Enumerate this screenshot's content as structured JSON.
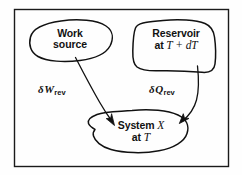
{
  "figure": {
    "name": "reversible-heat-and-work-exchange-diagram",
    "frame_color": "#1a1a1a",
    "ink_color": "#111111",
    "background": "#fefefe",
    "width": 242,
    "height": 175
  },
  "nodes": {
    "work_source": {
      "line1": "Work",
      "line2": "source"
    },
    "reservoir": {
      "line1": "Reservoir",
      "line2_prefix": "at",
      "line2_math": "T + dT"
    },
    "system": {
      "line1_prefix": "System",
      "line1_math": "X",
      "line2_prefix": "at",
      "line2_math": "T"
    }
  },
  "flows": {
    "work": {
      "delta": "δ",
      "symbol": "W",
      "subscript": "rev",
      "from": "work_source",
      "to": "system"
    },
    "heat": {
      "delta": "δ",
      "symbol": "Q",
      "subscript": "rev",
      "from": "reservoir",
      "to": "system"
    }
  }
}
